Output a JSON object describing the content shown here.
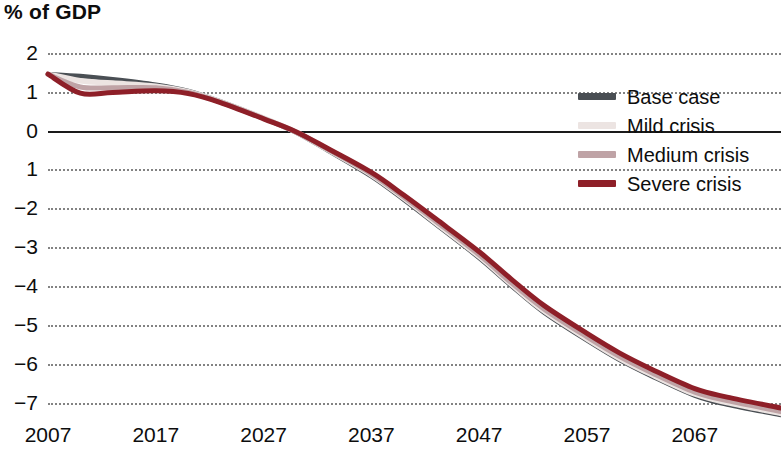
{
  "chart_data": {
    "type": "line",
    "title": "% of GDP",
    "xlabel": "",
    "ylabel": "% of GDP",
    "xlim": [
      2007,
      2075
    ],
    "ylim": [
      -7.5,
      2.2
    ],
    "grid": true,
    "grid_style": "dotted-horizontal",
    "zero_line": true,
    "legend_position": "right-top",
    "x_ticks": [
      "2007",
      "2017",
      "2027",
      "2037",
      "2047",
      "2057",
      "2067"
    ],
    "x_tick_values": [
      2007,
      2017,
      2027,
      2037,
      2047,
      2057,
      2067
    ],
    "y_ticks": [
      "2",
      "1",
      "0",
      "1",
      "−2",
      "−3",
      "−4",
      "−5",
      "−6",
      "−7"
    ],
    "y_tick_values": [
      2,
      1,
      0,
      -1,
      -2,
      -3,
      -4,
      -5,
      -6,
      -7
    ],
    "x": [
      2007,
      2010,
      2013,
      2017,
      2020,
      2023,
      2027,
      2030,
      2033,
      2037,
      2040,
      2043,
      2047,
      2050,
      2053,
      2057,
      2060,
      2063,
      2067,
      2070,
      2075
    ],
    "series": [
      {
        "name": "Base case",
        "color": "#4a4f54",
        "values": [
          1.45,
          1.4,
          1.32,
          1.18,
          1.02,
          0.75,
          0.32,
          -0.05,
          -0.52,
          -1.18,
          -1.78,
          -2.42,
          -3.28,
          -4.0,
          -4.68,
          -5.4,
          -5.9,
          -6.32,
          -6.82,
          -7.05,
          -7.32
        ]
      },
      {
        "name": "Mild crisis",
        "color": "#ece4e2",
        "values": [
          1.45,
          1.28,
          1.22,
          1.14,
          1.0,
          0.74,
          0.32,
          -0.04,
          -0.5,
          -1.14,
          -1.74,
          -2.38,
          -3.24,
          -3.96,
          -4.64,
          -5.36,
          -5.86,
          -6.28,
          -6.78,
          -7.0,
          -7.28
        ]
      },
      {
        "name": "Medium crisis",
        "color": "#bfa3a6",
        "values": [
          1.45,
          1.12,
          1.1,
          1.1,
          0.98,
          0.73,
          0.31,
          -0.04,
          -0.49,
          -1.12,
          -1.71,
          -2.34,
          -3.2,
          -3.92,
          -4.59,
          -5.31,
          -5.81,
          -6.23,
          -6.73,
          -6.95,
          -7.23
        ]
      },
      {
        "name": "Severe crisis",
        "color": "#8e1f28",
        "values": [
          1.45,
          0.96,
          0.98,
          1.02,
          0.95,
          0.72,
          0.3,
          -0.03,
          -0.47,
          -1.08,
          -1.66,
          -2.28,
          -3.12,
          -3.83,
          -4.5,
          -5.22,
          -5.72,
          -6.14,
          -6.64,
          -6.86,
          -7.14
        ]
      }
    ]
  },
  "legend": {
    "items": [
      {
        "label": "Base case",
        "color": "#4a4f54"
      },
      {
        "label": "Mild crisis",
        "color": "#ece4e2"
      },
      {
        "label": "Medium crisis",
        "color": "#bfa3a6"
      },
      {
        "label": "Severe crisis",
        "color": "#8e1f28"
      }
    ]
  }
}
